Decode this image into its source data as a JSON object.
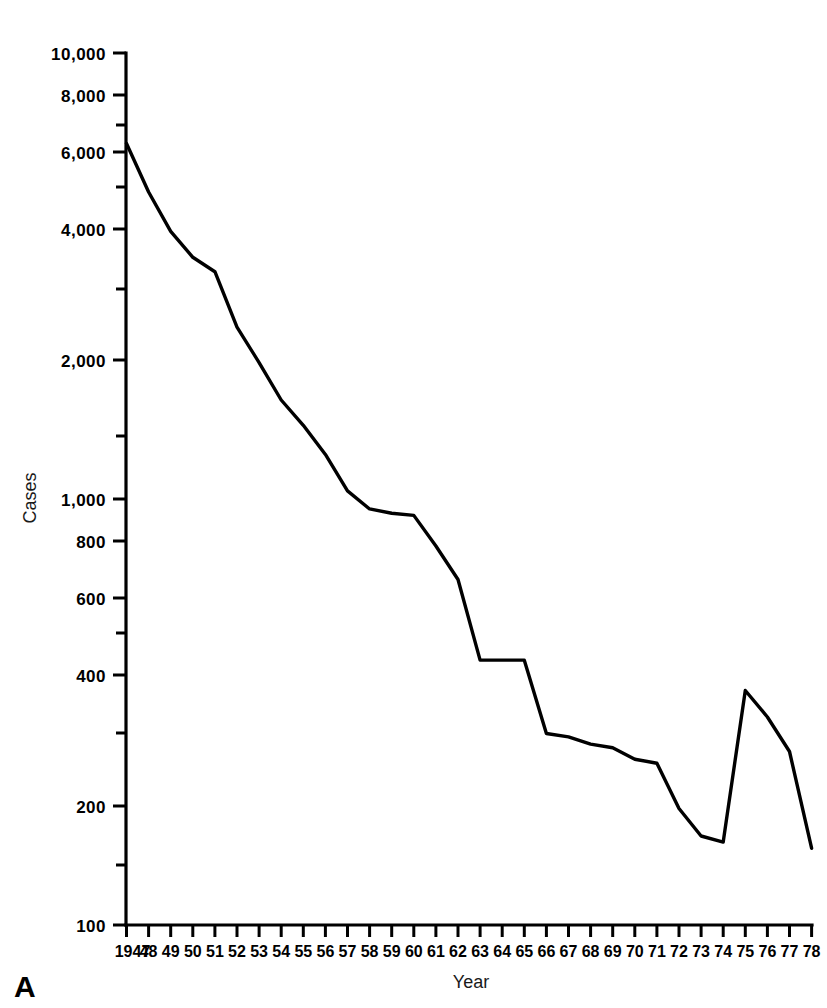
{
  "panel": {
    "letter": "A"
  },
  "chart_data": {
    "type": "line",
    "title": "",
    "xlabel": "Year",
    "ylabel": "Cases",
    "yscale": "log",
    "ylim": [
      100,
      10000
    ],
    "grid": false,
    "legend": null,
    "y_tick_labels": [
      "10,000",
      "8,000",
      "6,000",
      "4,000",
      "2,000",
      "1,000",
      "800",
      "600",
      "400",
      "200",
      "100"
    ],
    "y_tick_values": [
      10000,
      8000,
      6000,
      4000,
      2000,
      1000,
      800,
      600,
      400,
      200,
      100
    ],
    "x_tick_labels": [
      "1947",
      "48",
      "49",
      "50",
      "51",
      "52",
      "53",
      "54",
      "55",
      "56",
      "57",
      "58",
      "59",
      "60",
      "61",
      "62",
      "63",
      "64",
      "65",
      "66",
      "67",
      "68",
      "69",
      "70",
      "71",
      "72",
      "73",
      "74",
      "75",
      "76",
      "77",
      "78"
    ],
    "categories": [
      1947,
      1948,
      1949,
      1950,
      1951,
      1952,
      1953,
      1954,
      1955,
      1956,
      1957,
      1958,
      1959,
      1960,
      1961,
      1962,
      1963,
      1964,
      1965,
      1966,
      1967,
      1968,
      1969,
      1970,
      1971,
      1972,
      1973,
      1974,
      1975,
      1976,
      1977,
      1978
    ],
    "values": [
      6200,
      4800,
      3900,
      3400,
      3150,
      2350,
      1950,
      1600,
      1400,
      1200,
      990,
      900,
      880,
      870,
      740,
      620,
      405,
      405,
      405,
      275,
      270,
      260,
      255,
      240,
      235,
      185,
      160,
      155,
      345,
      300,
      250,
      150
    ]
  }
}
